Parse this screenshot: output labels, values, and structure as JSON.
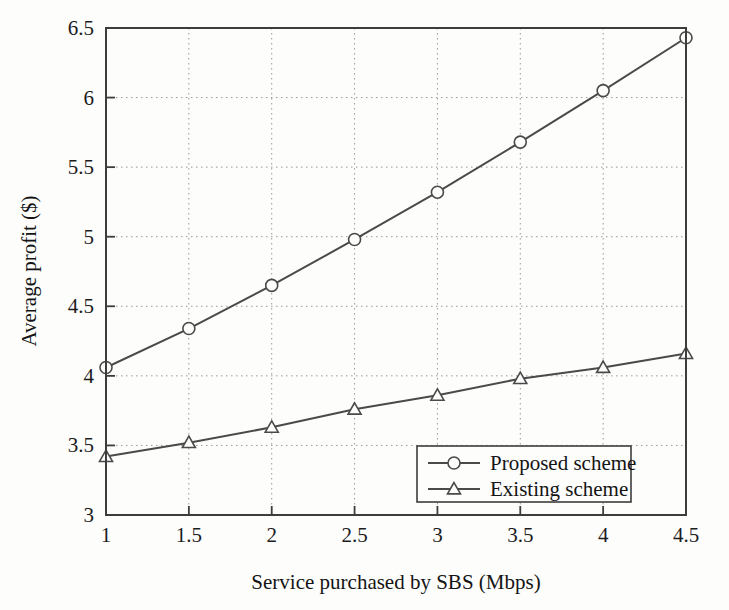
{
  "chart_data": {
    "type": "line",
    "title": "",
    "subtitle": "",
    "xlabel": "Service purchased by SBS (Mbps)",
    "ylabel": "Average profit ($)",
    "x": [
      1,
      1.5,
      2,
      2.5,
      3,
      3.5,
      4,
      4.5
    ],
    "xlim": [
      1,
      4.5
    ],
    "ylim": [
      3,
      6.5
    ],
    "xticks": [
      "1",
      "1.5",
      "2",
      "2.5",
      "3",
      "3.5",
      "4",
      "4.5"
    ],
    "yticks": [
      "3",
      "3.5",
      "4",
      "4.5",
      "5",
      "5.5",
      "6",
      "6.5"
    ],
    "grid": true,
    "grid_style": "dotted",
    "legend_position": "lower-right",
    "series": [
      {
        "name": "Proposed scheme",
        "marker": "circle",
        "color": "#4a4a4a",
        "values": [
          4.06,
          4.34,
          4.65,
          4.98,
          5.32,
          5.68,
          6.05,
          6.43
        ]
      },
      {
        "name": "Existing scheme",
        "marker": "triangle",
        "color": "#4a4a4a",
        "values": [
          3.42,
          3.52,
          3.63,
          3.76,
          3.86,
          3.98,
          4.06,
          4.16
        ]
      }
    ]
  },
  "axes": {
    "x_title": "Service purchased by SBS (Mbps)",
    "y_title": "Average profit ($)",
    "x_tick_labels": [
      "1",
      "1.5",
      "2",
      "2.5",
      "3",
      "3.5",
      "4",
      "4.5"
    ],
    "y_tick_labels": [
      "3",
      "3.5",
      "4",
      "4.5",
      "5",
      "5.5",
      "6",
      "6.5"
    ]
  },
  "legend": {
    "entries": [
      {
        "label": "Proposed scheme",
        "marker": "circle-marker"
      },
      {
        "label": "Existing scheme",
        "marker": "triangle-marker"
      }
    ]
  },
  "style": {
    "background": "#fdfdfc",
    "axis_color": "#3d3d3d",
    "grid_color": "#999999",
    "line_color": "#4a4a4a",
    "text_color": "#141414"
  }
}
